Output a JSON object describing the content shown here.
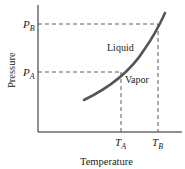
{
  "diagram": {
    "type": "phase-diagram",
    "x_axis_label": "Temperature",
    "y_axis_label": "Pressure",
    "region_labels": {
      "upper": "Liquid",
      "lower": "Vapor"
    },
    "points": [
      {
        "name": "A",
        "p_label": "P",
        "p_sub": "A",
        "t_label": "T",
        "t_sub": "A"
      },
      {
        "name": "B",
        "p_label": "P",
        "p_sub": "B",
        "t_label": "T",
        "t_sub": "B"
      }
    ],
    "colors": {
      "curve": "#555555",
      "axis": "#222222",
      "dashed": "#333333",
      "text": "#222222"
    }
  }
}
